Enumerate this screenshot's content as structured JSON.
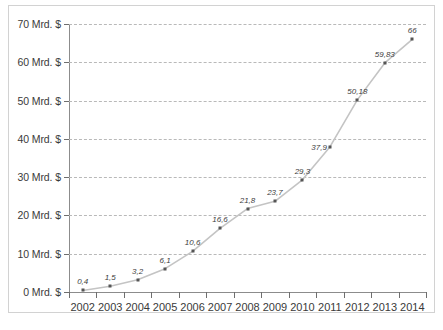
{
  "chart_data": {
    "type": "line",
    "title": "",
    "subtitle": "",
    "xlabel": "",
    "ylabel": "",
    "categories": [
      "2002",
      "2003",
      "2004",
      "2005",
      "2006",
      "2007",
      "2008",
      "2009",
      "2010",
      "2011",
      "2012",
      "2013",
      "2014"
    ],
    "values": [
      0.4,
      1.5,
      3.2,
      6.1,
      10.6,
      16.6,
      21.8,
      23.7,
      29.3,
      37.9,
      50.18,
      59.83,
      66
    ],
    "point_labels": [
      "0,4",
      "1,5",
      "3,2",
      "6,1",
      "10,6",
      "16,6",
      "21,8",
      "23,7",
      "29,3",
      "37,9",
      "50,18",
      "59,83",
      "66"
    ],
    "label_placement": [
      "above",
      "above",
      "above",
      "above",
      "above",
      "above",
      "above",
      "above",
      "above",
      "side",
      "above",
      "above",
      "above"
    ],
    "ylim": [
      0,
      70
    ],
    "yticks": [
      0,
      10,
      20,
      30,
      40,
      50,
      60,
      70
    ],
    "ytick_labels": [
      "0 Mrd. $",
      "10 Mrd. $",
      "20 Mrd. $",
      "30 Mrd. $",
      "40 Mrd. $",
      "50 Mrd. $",
      "60 Mrd. $",
      "70 Mrd. $"
    ],
    "unit": "Mrd. $",
    "grid": "horizontal-dashed",
    "legend": "none",
    "series_color": "#c4c4c4",
    "marker_color": "#555555",
    "grid_color": "#b9b9b9",
    "axis_color": "#8c8c8c",
    "text_color": "#3a3a3a",
    "background": "#ffffff"
  }
}
